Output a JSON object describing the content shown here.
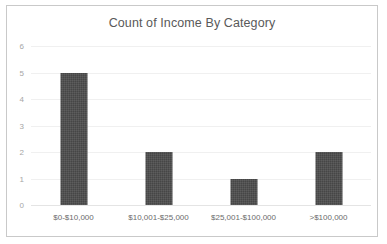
{
  "chart_data": {
    "type": "bar",
    "title": "Count of Income By Category",
    "xlabel": "",
    "ylabel": "",
    "categories": [
      "$0-$10,000",
      "$10,001-$25,000",
      "$25,001-$100,000",
      ">$100,000"
    ],
    "values": [
      5,
      2,
      1,
      2
    ],
    "ylim": [
      0,
      6
    ],
    "ytick_labels": [
      "6",
      "5",
      "4",
      "3",
      "2",
      "1",
      "0"
    ],
    "ytick_values": [
      6,
      5,
      4,
      3,
      2,
      1,
      0
    ],
    "grid": "horizontal",
    "legend": "none",
    "bar_color": "#4d4d4d",
    "gridline_color": "#f0f0f0",
    "title_color": "#595959",
    "border_color": "#c9c9c9"
  }
}
